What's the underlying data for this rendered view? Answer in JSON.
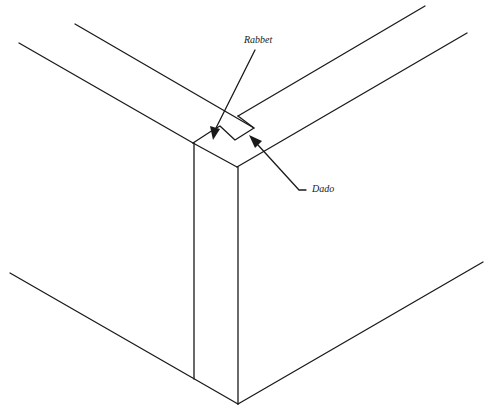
{
  "diagram": {
    "stroke_color": "#1a1a1a",
    "background": "#ffffff",
    "labels": {
      "rabbet": "Rabbet",
      "dado": "Dado"
    },
    "callouts": [
      {
        "label": "Rabbet",
        "target": "rabbet-notch"
      },
      {
        "label": "Dado",
        "target": "dado-groove"
      }
    ]
  }
}
